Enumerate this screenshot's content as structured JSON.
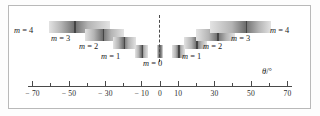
{
  "figure": {
    "kind": "diffraction-spectrum-diagram",
    "axis_label": "θ/°",
    "center_marker": "dashed vertical line at 0°"
  },
  "chart_data": {
    "type": "bar",
    "title": "",
    "subtitle": "",
    "xlabel": "θ/°",
    "ylabel": "",
    "xlim": [
      -70,
      70
    ],
    "grid": false,
    "legend": "none",
    "tick_values": [
      -70,
      -60,
      -50,
      -40,
      -30,
      -20,
      -10,
      0,
      10,
      20,
      30,
      40,
      50,
      60,
      70
    ],
    "tick_labels": [
      "− 70",
      "",
      "− 50",
      "",
      "− 30",
      "",
      "− 10",
      "0",
      "10",
      "",
      "30",
      "",
      "50",
      "",
      "70"
    ],
    "categories": [
      "m = 4 (left)",
      "m = 3 (left)",
      "m = 2 (left)",
      "m = 1 (left)",
      "m = 0",
      "m = 1 (right)",
      "m = 2 (right)",
      "m = 3 (right)",
      "m = 4 (right)"
    ],
    "series": [
      {
        "name": "diffraction orders",
        "bands": [
          {
            "order": 4,
            "side": "left",
            "theta_start": -61.0,
            "theta_end": -27.5,
            "theta_peak": -47.0,
            "row": 0
          },
          {
            "order": 3,
            "side": "left",
            "theta_start": -41.0,
            "theta_end": -20.0,
            "theta_peak": -31.5,
            "row": 1
          },
          {
            "order": 2,
            "side": "left",
            "theta_start": -26.0,
            "theta_end": -13.0,
            "theta_peak": -20.0,
            "row": 2
          },
          {
            "order": 1,
            "side": "left",
            "theta_start": -13.5,
            "theta_end": -6.5,
            "theta_peak": -10.0,
            "row": 3
          },
          {
            "order": 0,
            "side": "center",
            "theta_start": -1.8,
            "theta_end": 1.8,
            "theta_peak": 0.0,
            "row": 3
          },
          {
            "order": 1,
            "side": "right",
            "theta_start": 6.5,
            "theta_end": 13.5,
            "theta_peak": 10.0,
            "row": 3
          },
          {
            "order": 2,
            "side": "right",
            "theta_start": 13.0,
            "theta_end": 26.0,
            "theta_peak": 20.0,
            "row": 2
          },
          {
            "order": 3,
            "side": "right",
            "theta_start": 20.0,
            "theta_end": 41.0,
            "theta_peak": 31.5,
            "row": 1
          },
          {
            "order": 4,
            "side": "right",
            "theta_start": 27.5,
            "theta_end": 61.0,
            "theta_peak": 47.0,
            "row": 0
          }
        ]
      }
    ],
    "annotations": [
      {
        "id": "m4L",
        "text": "m = 4",
        "m": "m",
        "eq": "= 4"
      },
      {
        "id": "m3L",
        "text": "m = 3",
        "m": "m",
        "eq": "= 3"
      },
      {
        "id": "m2L",
        "text": "m = 2",
        "m": "m",
        "eq": "= 2"
      },
      {
        "id": "m1L",
        "text": "m = 1",
        "m": "m",
        "eq": "= 1"
      },
      {
        "id": "m0",
        "text": "m = 0",
        "m": "m",
        "eq": "= 0"
      },
      {
        "id": "m1R",
        "text": "m = 1",
        "m": "m",
        "eq": "= 1"
      },
      {
        "id": "m2R",
        "text": "m = 2",
        "m": "m",
        "eq": "= 2"
      },
      {
        "id": "m3R",
        "text": "m = 3",
        "m": "m",
        "eq": "= 3"
      },
      {
        "id": "m4R",
        "text": "m = 4",
        "m": "m",
        "eq": "= 4"
      }
    ],
    "colors": {
      "band_light": "#e3e3e3",
      "band_mid": "#b4b4b4",
      "band_dark": "#6e6e6e",
      "peak_line": "#3a3a3a",
      "axis": "#4a4a4a",
      "frame": "#b9b9b9",
      "text": "#1c1c1c"
    }
  }
}
